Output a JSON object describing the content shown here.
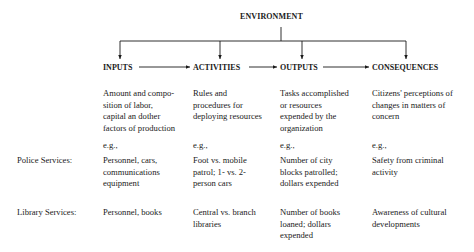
{
  "diagram": {
    "top_node": "ENVIRONMENT",
    "stages": [
      {
        "label": "INPUTS",
        "definition": "Amount and compo-\nsition of labor,\ncapital an dother\nfactors of production"
      },
      {
        "label": "ACTIVITIES",
        "definition": "Rules and\nprocedures for\ndeploying resources"
      },
      {
        "label": "OUTPUTS",
        "definition": "Tasks accomplished\nor resources\nexpended by the\norganization"
      },
      {
        "label": "CONSEQUENCES",
        "definition": "Citizens' perceptions of\nchanges in matters of\nconcern"
      }
    ],
    "example_label": "e.g.,",
    "rows": [
      {
        "label": "Police Services:",
        "cells": [
          "Personnel, cars,\ncommunications\nequipment",
          "Foot vs. mobile\npatrol; 1-  vs. 2-\nperson cars",
          "Number of city\nblocks patrolled;\ndollars expended",
          "Safety from criminal\nactivity"
        ]
      },
      {
        "label": "Library Services:",
        "cells": [
          "Personnel, books",
          "Central vs. branch\nlibraries",
          "Number of books\nloaned; dollars\nexpended",
          "Awareness of cultural\ndevelopments"
        ]
      }
    ]
  }
}
